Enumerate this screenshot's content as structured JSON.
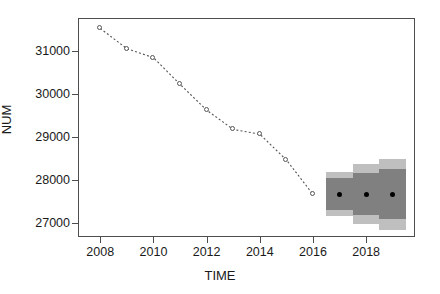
{
  "chart_data": {
    "type": "line",
    "title": "",
    "xlabel": "TIME",
    "ylabel": "NUM",
    "xlim": [
      2007.2,
      2019.8
    ],
    "ylim": [
      26700,
      31750
    ],
    "grid": false,
    "legend": null,
    "x_ticks": [
      2008,
      2010,
      2012,
      2014,
      2016,
      2018
    ],
    "x_tick_labels": [
      "2008",
      "2010",
      "2012",
      "2014",
      "2016",
      "2018"
    ],
    "y_ticks": [
      27000,
      28000,
      29000,
      30000,
      31000
    ],
    "y_tick_labels": [
      "27000",
      "28000",
      "29000",
      "30000",
      "31000"
    ],
    "series": [
      {
        "name": "observed",
        "style": "dashed line with open circle markers",
        "color": "#555555",
        "x": [
          2008,
          2009,
          2010,
          2011,
          2012,
          2013,
          2014,
          2015,
          2016
        ],
        "values": [
          31530,
          31060,
          30850,
          30230,
          29630,
          29180,
          29070,
          28470,
          27670
        ]
      },
      {
        "name": "forecast",
        "style": "point forecast with prediction intervals",
        "color": "#000000",
        "x": [
          2017,
          2018,
          2019
        ],
        "values": [
          27670,
          27670,
          27670
        ]
      }
    ],
    "intervals": [
      {
        "name": "80% prediction interval",
        "color": "#808080",
        "x": [
          2017,
          2018,
          2019
        ],
        "lower": [
          27300,
          27180,
          27100
        ],
        "upper": [
          28050,
          28170,
          28250
        ]
      },
      {
        "name": "95% prediction interval",
        "color": "#bfbfbf",
        "x": [
          2017,
          2018,
          2019
        ],
        "lower": [
          27170,
          26980,
          26830
        ],
        "upper": [
          28180,
          28370,
          28500
        ]
      }
    ]
  },
  "axes": {
    "x_title": "TIME",
    "y_title": "NUM"
  }
}
